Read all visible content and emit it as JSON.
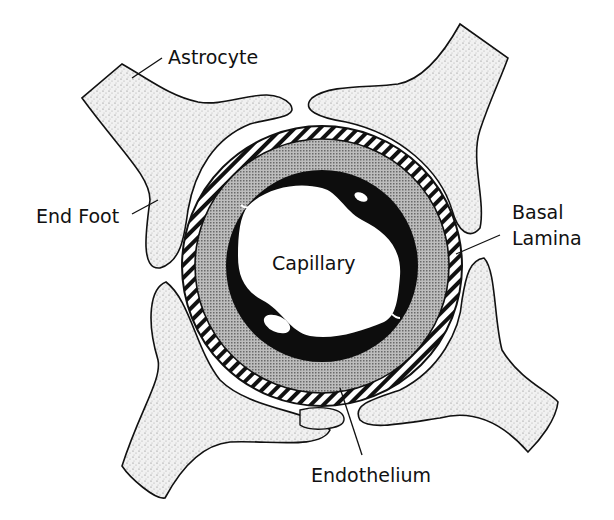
{
  "diagram": {
    "labels": {
      "astrocyte": "Astrocyte",
      "end_foot": "End Foot",
      "basal_lamina": [
        "Basal",
        "Lamina"
      ],
      "capillary": "Capillary",
      "endothelium": "Endothelium"
    },
    "structures": [
      {
        "name": "astrocyte-process",
        "count": 4,
        "fill": "stippled-light-gray"
      },
      {
        "name": "basal-lamina",
        "fill": "diagonal-hatch"
      },
      {
        "name": "pericapillary-layer",
        "fill": "dense-stipple-gray"
      },
      {
        "name": "endothelium",
        "fill": "#000000"
      },
      {
        "name": "capillary-lumen",
        "fill": "#ffffff"
      }
    ],
    "colors": {
      "ink": "#111111",
      "stipple_bg": "#ececec",
      "ring_gray": "#9a9a9a",
      "background": "#ffffff"
    }
  }
}
